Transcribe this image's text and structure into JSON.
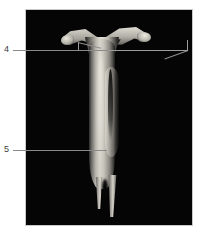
{
  "figure": {
    "type": "annotated-specimen-photograph",
    "background_color": "#ffffff",
    "plate_color": "#050505",
    "plate_border_color": "#c9c9c9",
    "subject_description": "Grayscale photograph of a dissected elongate specimen with a forked Y-shaped head and two tapering prongs at the base, mounted against a black background",
    "caption": ""
  },
  "annotations": [
    {
      "id": "4",
      "label": "4",
      "line_color": "#8a8a8a",
      "points_to": "forked-head-region"
    },
    {
      "id": "5",
      "label": "5",
      "line_color": "#8a8a8a",
      "points_to": "mid-shaft-region"
    }
  ],
  "bracket": {
    "name": "measurement-bracket",
    "color": "#9c9c9c",
    "label": ""
  },
  "specimen_parts": {
    "fork_left": "left-fork-arm",
    "fork_right": "right-fork-arm",
    "shaft": "main-shaft",
    "prong_left": "left-distal-prong",
    "prong_right": "right-distal-prong"
  }
}
